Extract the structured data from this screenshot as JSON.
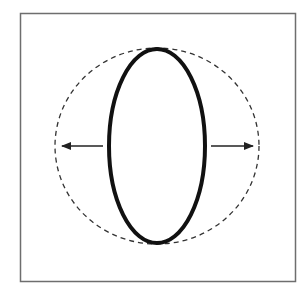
{
  "diagram": {
    "type": "shape-expansion",
    "colors": {
      "background": "#ffffff",
      "frame": "#6e6e6e",
      "ellipse": "#111111",
      "dashed_circle": "#333333",
      "arrows": "#222222"
    },
    "frame": {
      "x": 20,
      "y": 13,
      "width": 275,
      "height": 268
    },
    "dashed_circle": {
      "cx": 157,
      "cy": 146,
      "rx": 102,
      "ry": 98
    },
    "ellipse": {
      "cx": 157,
      "cy": 146,
      "rx": 48,
      "ry": 97
    },
    "arrows": [
      {
        "direction": "left",
        "x1": 103,
        "y1": 146,
        "x2": 62,
        "y2": 146
      },
      {
        "direction": "right",
        "x1": 211,
        "y1": 146,
        "x2": 253,
        "y2": 146
      }
    ]
  }
}
